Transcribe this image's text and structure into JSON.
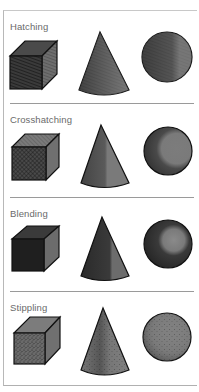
{
  "sections": [
    {
      "title": "Hatching",
      "technique": "hatching",
      "shapes": [
        "cube",
        "cone",
        "sphere"
      ]
    },
    {
      "title": "Crosshatching",
      "technique": "crosshatching",
      "shapes": [
        "cube",
        "cone",
        "sphere"
      ]
    },
    {
      "title": "Blending",
      "technique": "blending",
      "shapes": [
        "cube",
        "cone",
        "sphere"
      ]
    },
    {
      "title": "Stippling",
      "technique": "stippling",
      "shapes": [
        "cube",
        "cone",
        "sphere"
      ]
    }
  ],
  "colors": {
    "outline": "#111111",
    "dark": "#2e2e2e",
    "mid": "#5a5a5a",
    "light": "#8c8c8c",
    "separator": "#9a9a9a",
    "title": "#6a6a6a"
  }
}
